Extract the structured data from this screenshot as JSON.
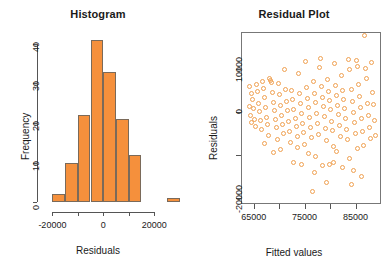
{
  "figure": {
    "background": "#ffffff",
    "accent_color": "#F5903C",
    "point_color": "#F0A050",
    "axis_color": "#555555"
  },
  "panels": {
    "histogram": {
      "title": "Histogram",
      "xlabel": "Residuals",
      "ylabel": "Frequency"
    },
    "residual": {
      "title": "Residual Plot",
      "xlabel": "Fitted values",
      "ylabel": "Residuals"
    }
  },
  "chart_data": [
    {
      "type": "bar",
      "title": "Histogram",
      "xlabel": "Residuals",
      "ylabel": "Frequency",
      "xlim": [
        -22500,
        32500
      ],
      "ylim": [
        0,
        43
      ],
      "xticks": [
        -20000,
        -10000,
        0,
        10000,
        20000
      ],
      "xtick_labels": [
        "-20000",
        "",
        "0",
        "",
        "20000"
      ],
      "yticks": [
        0,
        10,
        20,
        30,
        40
      ],
      "ytick_labels": [
        "0",
        "10",
        "20",
        "30",
        "40"
      ],
      "grid": false,
      "legend": "none",
      "bin_width": 5000,
      "bin_edges": [
        -20000,
        -15000,
        -10000,
        -5000,
        0,
        5000,
        10000,
        15000,
        25000,
        30000
      ],
      "categories": [
        "-20000 to -15000",
        "-15000 to -10000",
        "-10000 to -5000",
        "-5000 to 0",
        "0 to 5000",
        "5000 to 10000",
        "10000 to 15000",
        "25000 to 30000"
      ],
      "values": [
        2,
        10,
        22,
        41,
        33,
        21,
        12,
        1
      ],
      "bars": [
        {
          "x0": -20000,
          "x1": -15000,
          "height": 2
        },
        {
          "x0": -15000,
          "x1": -10000,
          "height": 10
        },
        {
          "x0": -10000,
          "x1": -5000,
          "height": 22
        },
        {
          "x0": -5000,
          "x1": 0,
          "height": 41
        },
        {
          "x0": 0,
          "x1": 5000,
          "height": 33
        },
        {
          "x0": 5000,
          "x1": 10000,
          "height": 21
        },
        {
          "x0": 10000,
          "x1": 15000,
          "height": 12
        },
        {
          "x0": 25000,
          "x1": 30000,
          "height": 1
        }
      ]
    },
    {
      "type": "scatter",
      "title": "Residual Plot",
      "xlabel": "Fitted values",
      "ylabel": "Residuals",
      "xlim": [
        62500,
        90000
      ],
      "ylim": [
        -21500,
        18500
      ],
      "xticks": [
        65000,
        70000,
        75000,
        80000,
        85000
      ],
      "xtick_labels": [
        "65000",
        "",
        "75000",
        "",
        "85000"
      ],
      "yticks": [
        -20000,
        -10000,
        0,
        10000,
        20000
      ],
      "ytick_labels": [
        "-20000",
        "",
        "0",
        "10000",
        ""
      ],
      "grid": false,
      "legend": "none",
      "marker": "open-circle",
      "points": [
        [
          64200,
          5900
        ],
        [
          64500,
          4100
        ],
        [
          64100,
          1200
        ],
        [
          64300,
          -900
        ],
        [
          64600,
          -2600
        ],
        [
          64800,
          2700
        ],
        [
          64900,
          800
        ],
        [
          65100,
          -1800
        ],
        [
          65300,
          -3500
        ],
        [
          65500,
          6200
        ],
        [
          65700,
          4700
        ],
        [
          65900,
          1900
        ],
        [
          66100,
          100
        ],
        [
          66300,
          -2100
        ],
        [
          66500,
          -4200
        ],
        [
          66700,
          7100
        ],
        [
          66900,
          5400
        ],
        [
          67100,
          3200
        ],
        [
          67300,
          900
        ],
        [
          67500,
          -1400
        ],
        [
          67700,
          -3100
        ],
        [
          67900,
          -5600
        ],
        [
          68100,
          7600
        ],
        [
          68300,
          7200
        ],
        [
          68500,
          6800
        ],
        [
          68700,
          4400
        ],
        [
          68900,
          2100
        ],
        [
          69100,
          300
        ],
        [
          69300,
          -1900
        ],
        [
          69500,
          -3800
        ],
        [
          69700,
          -6400
        ],
        [
          69900,
          6600
        ],
        [
          70100,
          3900
        ],
        [
          70300,
          1500
        ],
        [
          70500,
          -800
        ],
        [
          70700,
          -2900
        ],
        [
          70900,
          -5100
        ],
        [
          71100,
          9700
        ],
        [
          71300,
          5200
        ],
        [
          71500,
          2400
        ],
        [
          71700,
          200
        ],
        [
          71900,
          -2400
        ],
        [
          72100,
          -4600
        ],
        [
          72300,
          -7200
        ],
        [
          72500,
          4900
        ],
        [
          72700,
          2800
        ],
        [
          72900,
          600
        ],
        [
          73100,
          -1600
        ],
        [
          73300,
          -3400
        ],
        [
          73500,
          -5900
        ],
        [
          73700,
          8800
        ],
        [
          73900,
          4200
        ],
        [
          74100,
          1800
        ],
        [
          74300,
          -500
        ],
        [
          74500,
          -2700
        ],
        [
          74700,
          -4900
        ],
        [
          74900,
          -7600
        ],
        [
          75100,
          11700
        ],
        [
          75300,
          5600
        ],
        [
          75500,
          3100
        ],
        [
          75700,
          900
        ],
        [
          75900,
          -1300
        ],
        [
          76100,
          -3600
        ],
        [
          76300,
          -6100
        ],
        [
          76500,
          -18600
        ],
        [
          76700,
          6900
        ],
        [
          76900,
          4300
        ],
        [
          77100,
          2200
        ],
        [
          77300,
          -400
        ],
        [
          77500,
          -2800
        ],
        [
          77700,
          -5300
        ],
        [
          77900,
          10300
        ],
        [
          78100,
          12400
        ],
        [
          78300,
          5800
        ],
        [
          78500,
          3300
        ],
        [
          78700,
          1100
        ],
        [
          78900,
          -1100
        ],
        [
          79100,
          -3900
        ],
        [
          79300,
          -6800
        ],
        [
          79500,
          7400
        ],
        [
          79700,
          4600
        ],
        [
          79900,
          2600
        ],
        [
          80100,
          400
        ],
        [
          80300,
          -2200
        ],
        [
          80500,
          -4400
        ],
        [
          80700,
          -8100
        ],
        [
          80900,
          11200
        ],
        [
          81100,
          6100
        ],
        [
          81300,
          3700
        ],
        [
          81500,
          1400
        ],
        [
          81700,
          -700
        ],
        [
          81900,
          -3200
        ],
        [
          82100,
          -5700
        ],
        [
          82300,
          8300
        ],
        [
          82500,
          4800
        ],
        [
          82700,
          2900
        ],
        [
          82900,
          700
        ],
        [
          83100,
          -1700
        ],
        [
          83300,
          -4100
        ],
        [
          83500,
          -6600
        ],
        [
          83700,
          12100
        ],
        [
          83900,
          9900
        ],
        [
          84100,
          5100
        ],
        [
          84300,
          2300
        ],
        [
          84500,
          -300
        ],
        [
          84700,
          -2500
        ],
        [
          84900,
          -5000
        ],
        [
          85100,
          11900
        ],
        [
          85300,
          10600
        ],
        [
          85500,
          6300
        ],
        [
          85700,
          3400
        ],
        [
          85900,
          1000
        ],
        [
          86100,
          -1500
        ],
        [
          86300,
          -4700
        ],
        [
          86500,
          -7900
        ],
        [
          86700,
          17600
        ],
        [
          86900,
          10100
        ],
        [
          87100,
          7800
        ],
        [
          87300,
          2000
        ],
        [
          87500,
          -1000
        ],
        [
          87700,
          -3700
        ],
        [
          87900,
          -6300
        ],
        [
          88100,
          11400
        ],
        [
          88300,
          4500
        ],
        [
          88500,
          1600
        ],
        [
          88700,
          -2000
        ],
        [
          88900,
          -5500
        ],
        [
          78500,
          -12600
        ],
        [
          79900,
          -12200
        ],
        [
          80600,
          -11800
        ],
        [
          82400,
          -13100
        ],
        [
          84600,
          -13600
        ],
        [
          86200,
          -15200
        ],
        [
          72900,
          -11900
        ],
        [
          74300,
          -12400
        ],
        [
          75800,
          -9800
        ],
        [
          77200,
          -10400
        ],
        [
          81200,
          -9200
        ],
        [
          83800,
          -10800
        ],
        [
          85400,
          -8600
        ],
        [
          70300,
          -8900
        ],
        [
          68900,
          -9600
        ],
        [
          67200,
          -7400
        ],
        [
          73500,
          -8300
        ],
        [
          76900,
          -14100
        ],
        [
          79300,
          -16400
        ],
        [
          84100,
          -16900
        ]
      ]
    }
  ]
}
